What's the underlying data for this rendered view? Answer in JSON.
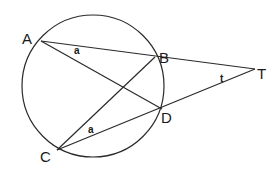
{
  "diagram": {
    "type": "circle-geometry",
    "circle": {
      "cx": 93,
      "cy": 86,
      "r": 71
    },
    "points": [
      {
        "name": "A",
        "x": 41,
        "y": 41,
        "label_x": 22,
        "label_y": 44
      },
      {
        "name": "B",
        "x": 155,
        "y": 57,
        "label_x": 159,
        "label_y": 63
      },
      {
        "name": "C",
        "x": 57,
        "y": 150,
        "label_x": 40,
        "label_y": 162
      },
      {
        "name": "D",
        "x": 162,
        "y": 109,
        "label_x": 161,
        "label_y": 123
      },
      {
        "name": "T",
        "x": 255,
        "y": 69,
        "label_x": 257,
        "label_y": 79
      }
    ],
    "segments": [
      {
        "id": "AT",
        "from": "A",
        "to": "T"
      },
      {
        "id": "CT",
        "from": "C",
        "to": "T"
      },
      {
        "id": "AD",
        "from": "A",
        "to": "D"
      },
      {
        "id": "CB",
        "from": "C",
        "to": "B"
      }
    ],
    "angle_labels": [
      {
        "text": "a",
        "at": "angle BAD",
        "x": 74,
        "y": 54
      },
      {
        "text": "a",
        "at": "angle BCD",
        "x": 88,
        "y": 133
      },
      {
        "text": "t",
        "at": "angle BTD",
        "x": 220,
        "y": 82
      }
    ]
  }
}
